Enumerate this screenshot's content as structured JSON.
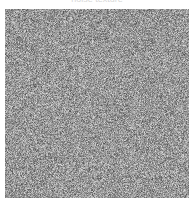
{
  "image": {
    "caption": "noise texture",
    "description": "Square field of random grayscale noise on a white background",
    "noise": {
      "x": 5,
      "y": 9,
      "width": 184,
      "height": 189,
      "min_gray": 70,
      "max_gray": 235,
      "mean_gray": 150,
      "seed": 1337
    },
    "colors": {
      "background": "#ffffff",
      "noise_mid": "#969696"
    }
  }
}
